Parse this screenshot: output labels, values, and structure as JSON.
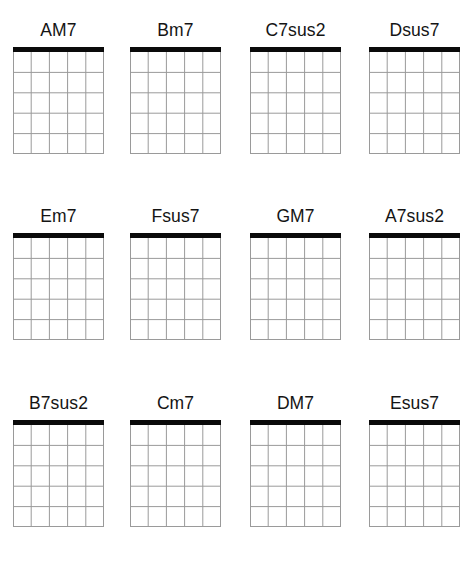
{
  "sheet": {
    "title": "Guitar chord diagram sheet",
    "background_color": "#ffffff",
    "nut_color": "#0a0a0a",
    "grid_line_color": "#9a9a9a",
    "label_color": "#141414",
    "columns": 4,
    "rows": 3,
    "diagram_spec": {
      "strings": 6,
      "string_gaps": 5,
      "frets": 5,
      "nut_shown": true,
      "markers": [],
      "open_or_muted_indicators": []
    }
  },
  "diagrams": [
    {
      "name": "AM7",
      "row": 1,
      "col": 1
    },
    {
      "name": "Bm7",
      "row": 1,
      "col": 2
    },
    {
      "name": "C7sus2",
      "row": 1,
      "col": 3
    },
    {
      "name": "Dsus7",
      "row": 1,
      "col": 4
    },
    {
      "name": "Em7",
      "row": 2,
      "col": 1
    },
    {
      "name": "Fsus7",
      "row": 2,
      "col": 2
    },
    {
      "name": "GM7",
      "row": 2,
      "col": 3
    },
    {
      "name": "A7sus2",
      "row": 2,
      "col": 4
    },
    {
      "name": "B7sus2",
      "row": 3,
      "col": 1
    },
    {
      "name": "Cm7",
      "row": 3,
      "col": 2
    },
    {
      "name": "DM7",
      "row": 3,
      "col": 3
    },
    {
      "name": "Esus7",
      "row": 3,
      "col": 4
    }
  ]
}
